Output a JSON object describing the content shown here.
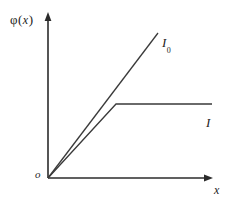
{
  "figure": {
    "background_color": "#ffffff",
    "line_color": "#3a3a3a",
    "axis_color": "#2b2b2b",
    "width": 234,
    "height": 203
  },
  "labels": {
    "y_axis_phi": "φ",
    "y_axis_open_paren": "(",
    "y_axis_variable": "x",
    "y_axis_close_paren": ")",
    "x_axis": "x",
    "origin": "o",
    "curve_upper": "I",
    "curve_upper_subscript": "0",
    "curve_lower": "I"
  },
  "chart_data": {
    "type": "line",
    "title": "",
    "xlabel": "x",
    "ylabel": "φ(x)",
    "xlim": [
      0,
      1
    ],
    "ylim": [
      0,
      1
    ],
    "grid": false,
    "legend": "inline-end-labels",
    "axes": {
      "origin_px": [
        48,
        178
      ],
      "y_axis_top_px": [
        48,
        14
      ],
      "x_axis_right_px": [
        212,
        178
      ],
      "arrows": [
        "y-up",
        "x-right"
      ]
    },
    "series": [
      {
        "name": "I0",
        "label": "I₀",
        "description": "straight line through origin, constant slope, no saturation",
        "points_px": [
          [
            48,
            178
          ],
          [
            158,
            33
          ]
        ],
        "x": [
          0,
          1
        ],
        "y": [
          0,
          1
        ]
      },
      {
        "name": "I",
        "label": "I",
        "description": "linear rise from origin then saturates to a constant plateau",
        "points_px": [
          [
            48,
            178
          ],
          [
            116,
            104
          ],
          [
            212,
            104
          ]
        ],
        "x": [
          0,
          0.41,
          1.0
        ],
        "y": [
          0,
          0.45,
          0.45
        ]
      }
    ],
    "annotations": [
      {
        "text": "I₀",
        "at_px": [
          162,
          42
        ]
      },
      {
        "text": "I",
        "at_px": [
          208,
          122
        ]
      },
      {
        "text": "o",
        "at_px": [
          38,
          175
        ]
      }
    ]
  }
}
